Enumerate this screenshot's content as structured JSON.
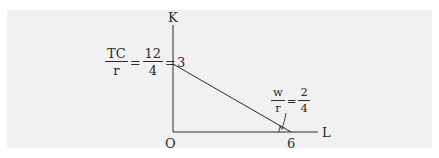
{
  "diagram": {
    "type": "isocost-line",
    "axes": {
      "y_label": "K",
      "x_label": "L",
      "origin_label": "O"
    },
    "y_intercept": {
      "fraction_num": "TC",
      "fraction_den": "r",
      "equals_1": "=",
      "value_num": "12",
      "value_den": "4",
      "equals_2": "=",
      "result": "3"
    },
    "x_intercept_label": "6",
    "slope_annotation": {
      "fraction_num": "w",
      "fraction_den": "r",
      "equals": "=",
      "value_num": "2",
      "value_den": "4"
    },
    "colors": {
      "background": "#ffffff",
      "panel": "#f1f1f1",
      "ink": "#2a2a2a"
    }
  }
}
